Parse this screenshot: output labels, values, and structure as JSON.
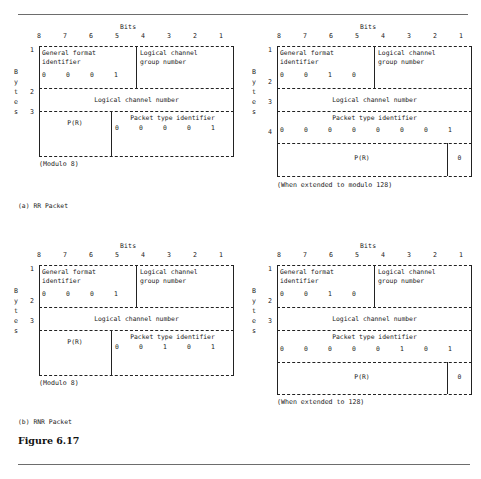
{
  "figure": {
    "label": "Figure 6.17",
    "bits_header": "Bits",
    "bit_numbers": [
      "8",
      "7",
      "6",
      "5",
      "4",
      "3",
      "2",
      "1"
    ],
    "bytes_label_letters": [
      "B",
      "y",
      "t",
      "e",
      "s"
    ],
    "field_names": {
      "gfi": "General format",
      "gfi2": "identifier",
      "lcgn": "Logical channel",
      "lcgn2": "group number",
      "lcn": "Logical channel number",
      "pr": "P(R)",
      "pti": "Packet type identifier"
    }
  },
  "panels": [
    {
      "id": "rr-modulo8",
      "position": "top-left",
      "caption": "(a) RR Packet",
      "subcaption": "(Modulo 8)",
      "byte_numbers": [
        "1",
        "2",
        "3"
      ],
      "gfi_bits": [
        "0",
        "0",
        "0",
        "1"
      ],
      "packet_type_bits": [
        "0",
        "0",
        "0",
        "0",
        "1"
      ],
      "has_pr_byte4": false
    },
    {
      "id": "rr-modulo128",
      "position": "top-right",
      "caption": "",
      "subcaption": "(When extended to modulo 128)",
      "byte_numbers": [
        "1",
        "2",
        "3",
        "4"
      ],
      "gfi_bits": [
        "0",
        "0",
        "1",
        "0"
      ],
      "packet_type_bits": [
        "0",
        "0",
        "0",
        "0",
        "0",
        "0",
        "0",
        "1"
      ],
      "has_pr_byte4": true,
      "pr_last_bit": "0"
    },
    {
      "id": "rnr-modulo8",
      "position": "bottom-left",
      "caption": "(b) RNR Packet",
      "subcaption": "(Modulo 8)",
      "byte_numbers": [
        "1",
        "2",
        "3"
      ],
      "gfi_bits": [
        "0",
        "0",
        "0",
        "1"
      ],
      "packet_type_bits": [
        "0",
        "0",
        "1",
        "0",
        "1"
      ],
      "has_pr_byte4": false
    },
    {
      "id": "rnr-modulo128",
      "position": "bottom-right",
      "caption": "",
      "subcaption": "(When extended to 128)",
      "byte_numbers": [
        "1",
        "2",
        "3",
        "4"
      ],
      "gfi_bits": [
        "0",
        "0",
        "1",
        "0"
      ],
      "packet_type_bits": [
        "0",
        "0",
        "0",
        "0",
        "0",
        "1",
        "0",
        "1"
      ],
      "has_pr_byte4": true,
      "pr_last_bit": "0"
    }
  ]
}
